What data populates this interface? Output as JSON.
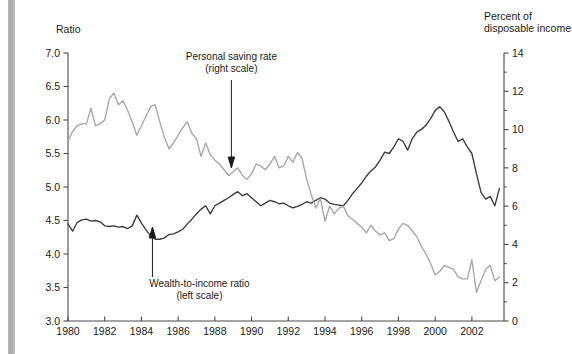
{
  "figure": {
    "left_axis_title": "Ratio",
    "right_axis_title_line1": "Percent of",
    "right_axis_title_line2": "disposable income",
    "annotation_saving_line1": "Personal saving rate",
    "annotation_saving_line2": "(right scale)",
    "annotation_wealth_line1": "Wealth-to-income ratio",
    "annotation_wealth_line2": "(left scale)",
    "colors": {
      "dark_series": "#3b3b3b",
      "gray_series": "#a6a6a6",
      "axis": "#4a4a4a",
      "text": "#1a1a1a",
      "background": "#ffffff",
      "edge_bar": "#b3b3b3"
    }
  },
  "chart_data": {
    "type": "line",
    "title": "",
    "subtitle": "",
    "xlabel": "",
    "ylabel": "Ratio",
    "y2label": "Percent of disposable income",
    "grid": false,
    "legend": "annotations-with-arrows",
    "xlim": [
      1980,
      2003.75
    ],
    "ylim": [
      3.0,
      7.0
    ],
    "y2lim": [
      0,
      14
    ],
    "xticks": [
      1980,
      1982,
      1984,
      1986,
      1988,
      1990,
      1992,
      1994,
      1996,
      1998,
      2000,
      2002
    ],
    "xtick_labels": [
      "1980",
      "1982",
      "1984",
      "1986",
      "1988",
      "1990",
      "1992",
      "1994",
      "1996",
      "1998",
      "2000",
      "2002"
    ],
    "yticks": [
      3.0,
      3.5,
      4.0,
      4.5,
      5.0,
      5.5,
      6.0,
      6.5,
      7.0
    ],
    "ytick_labels": [
      "3.0",
      "3.5",
      "4.0",
      "4.5",
      "5.0",
      "5.5",
      "6.0",
      "6.5",
      "7.0"
    ],
    "y2ticks": [
      0,
      2,
      4,
      6,
      8,
      10,
      12,
      14
    ],
    "y2tick_labels": [
      "0",
      "2",
      "4",
      "6",
      "8",
      "10",
      "12",
      "14"
    ],
    "y2_minor_ticks": [
      1,
      3,
      5,
      7,
      9,
      11,
      13
    ],
    "series": [
      {
        "name": "Wealth-to-income ratio",
        "axis": "left",
        "color": "#3b3b3b",
        "label": "Wealth-to-income ratio (left scale)",
        "x": [
          1980.0,
          1980.25,
          1980.5,
          1980.75,
          1981.0,
          1981.25,
          1981.5,
          1981.75,
          1982.0,
          1982.25,
          1982.5,
          1982.75,
          1983.0,
          1983.25,
          1983.5,
          1983.75,
          1984.0,
          1984.25,
          1984.5,
          1984.75,
          1985.0,
          1985.25,
          1985.5,
          1985.75,
          1986.0,
          1986.25,
          1986.5,
          1986.75,
          1987.0,
          1987.25,
          1987.5,
          1987.75,
          1988.0,
          1988.25,
          1988.5,
          1988.75,
          1989.0,
          1989.25,
          1989.5,
          1989.75,
          1990.0,
          1990.25,
          1990.5,
          1990.75,
          1991.0,
          1991.25,
          1991.5,
          1991.75,
          1992.0,
          1992.25,
          1992.5,
          1992.75,
          1993.0,
          1993.25,
          1993.5,
          1993.75,
          1994.0,
          1994.25,
          1994.5,
          1994.75,
          1995.0,
          1995.25,
          1995.5,
          1995.75,
          1996.0,
          1996.25,
          1996.5,
          1996.75,
          1997.0,
          1997.25,
          1997.5,
          1997.75,
          1998.0,
          1998.25,
          1998.5,
          1998.75,
          1999.0,
          1999.25,
          1999.5,
          1999.75,
          2000.0,
          2000.25,
          2000.5,
          2000.75,
          2001.0,
          2001.25,
          2001.5,
          2001.75,
          2002.0,
          2002.25,
          2002.5,
          2002.75,
          2003.0,
          2003.25,
          2003.5
        ],
        "y": [
          4.45,
          4.34,
          4.47,
          4.51,
          4.52,
          4.49,
          4.5,
          4.48,
          4.42,
          4.41,
          4.42,
          4.4,
          4.41,
          4.38,
          4.42,
          4.58,
          4.46,
          4.36,
          4.27,
          4.22,
          4.22,
          4.24,
          4.29,
          4.3,
          4.33,
          4.37,
          4.45,
          4.52,
          4.6,
          4.67,
          4.72,
          4.6,
          4.72,
          4.76,
          4.8,
          4.84,
          4.89,
          4.93,
          4.87,
          4.9,
          4.84,
          4.78,
          4.72,
          4.76,
          4.8,
          4.78,
          4.75,
          4.76,
          4.72,
          4.69,
          4.71,
          4.74,
          4.78,
          4.76,
          4.8,
          4.84,
          4.82,
          4.76,
          4.74,
          4.73,
          4.72,
          4.8,
          4.9,
          4.98,
          5.06,
          5.16,
          5.24,
          5.3,
          5.4,
          5.52,
          5.5,
          5.6,
          5.72,
          5.68,
          5.55,
          5.72,
          5.82,
          5.86,
          5.92,
          6.02,
          6.14,
          6.2,
          6.12,
          5.98,
          5.82,
          5.68,
          5.72,
          5.6,
          5.5,
          5.2,
          4.92,
          4.82,
          4.86,
          4.72,
          4.98
        ]
      },
      {
        "name": "Personal saving rate",
        "axis": "right",
        "color": "#a6a6a6",
        "label": "Personal saving rate (right scale)",
        "x": [
          1980.0,
          1980.25,
          1980.5,
          1980.75,
          1981.0,
          1981.25,
          1981.5,
          1981.75,
          1982.0,
          1982.25,
          1982.5,
          1982.75,
          1983.0,
          1983.25,
          1983.5,
          1983.75,
          1984.0,
          1984.25,
          1984.5,
          1984.75,
          1985.0,
          1985.25,
          1985.5,
          1985.75,
          1986.0,
          1986.25,
          1986.5,
          1986.75,
          1987.0,
          1987.25,
          1987.5,
          1987.75,
          1988.0,
          1988.25,
          1988.5,
          1988.75,
          1989.0,
          1989.25,
          1989.5,
          1989.75,
          1990.0,
          1990.25,
          1990.5,
          1990.75,
          1991.0,
          1991.25,
          1991.5,
          1991.75,
          1992.0,
          1992.25,
          1992.5,
          1992.75,
          1993.0,
          1993.25,
          1993.5,
          1993.75,
          1994.0,
          1994.25,
          1994.5,
          1994.75,
          1995.0,
          1995.25,
          1995.5,
          1995.75,
          1996.0,
          1996.25,
          1996.5,
          1996.75,
          1997.0,
          1997.25,
          1997.5,
          1997.75,
          1998.0,
          1998.25,
          1998.5,
          1998.75,
          1999.0,
          1999.25,
          1999.5,
          1999.75,
          2000.0,
          2000.25,
          2000.5,
          2000.75,
          2001.0,
          2001.25,
          2001.5,
          2001.75,
          2002.0,
          2002.25,
          2002.5,
          2002.75,
          2003.0,
          2003.25,
          2003.5
        ],
        "y": [
          9.4,
          9.9,
          10.2,
          10.3,
          10.3,
          11.1,
          10.2,
          10.3,
          10.5,
          11.6,
          11.9,
          11.3,
          11.5,
          11.0,
          10.4,
          9.7,
          10.2,
          10.7,
          11.2,
          11.3,
          10.4,
          9.6,
          9.0,
          9.3,
          9.7,
          10.1,
          10.4,
          9.8,
          9.5,
          8.6,
          9.3,
          8.7,
          8.4,
          8.2,
          7.9,
          7.6,
          7.8,
          8.0,
          7.6,
          7.4,
          7.7,
          8.2,
          8.1,
          7.9,
          8.2,
          8.6,
          8.0,
          8.1,
          8.6,
          8.3,
          8.8,
          8.5,
          7.4,
          6.6,
          5.9,
          6.4,
          5.2,
          6.0,
          5.6,
          5.9,
          6.0,
          5.5,
          5.3,
          5.1,
          4.9,
          4.6,
          5.0,
          4.7,
          4.5,
          4.6,
          4.2,
          4.3,
          4.8,
          5.1,
          5.0,
          4.7,
          4.4,
          3.9,
          3.5,
          3.0,
          2.4,
          2.6,
          2.9,
          2.8,
          2.7,
          2.3,
          2.2,
          2.2,
          3.2,
          1.5,
          2.1,
          2.7,
          2.9,
          2.1,
          2.3
        ]
      }
    ],
    "annotations": [
      {
        "text": "Personal saving rate (right scale)",
        "points_to_series": "Personal saving rate",
        "at_x": 1988.9
      },
      {
        "text": "Wealth-to-income ratio (left scale)",
        "points_to_series": "Wealth-to-income ratio",
        "at_x": 1984.6
      }
    ]
  }
}
